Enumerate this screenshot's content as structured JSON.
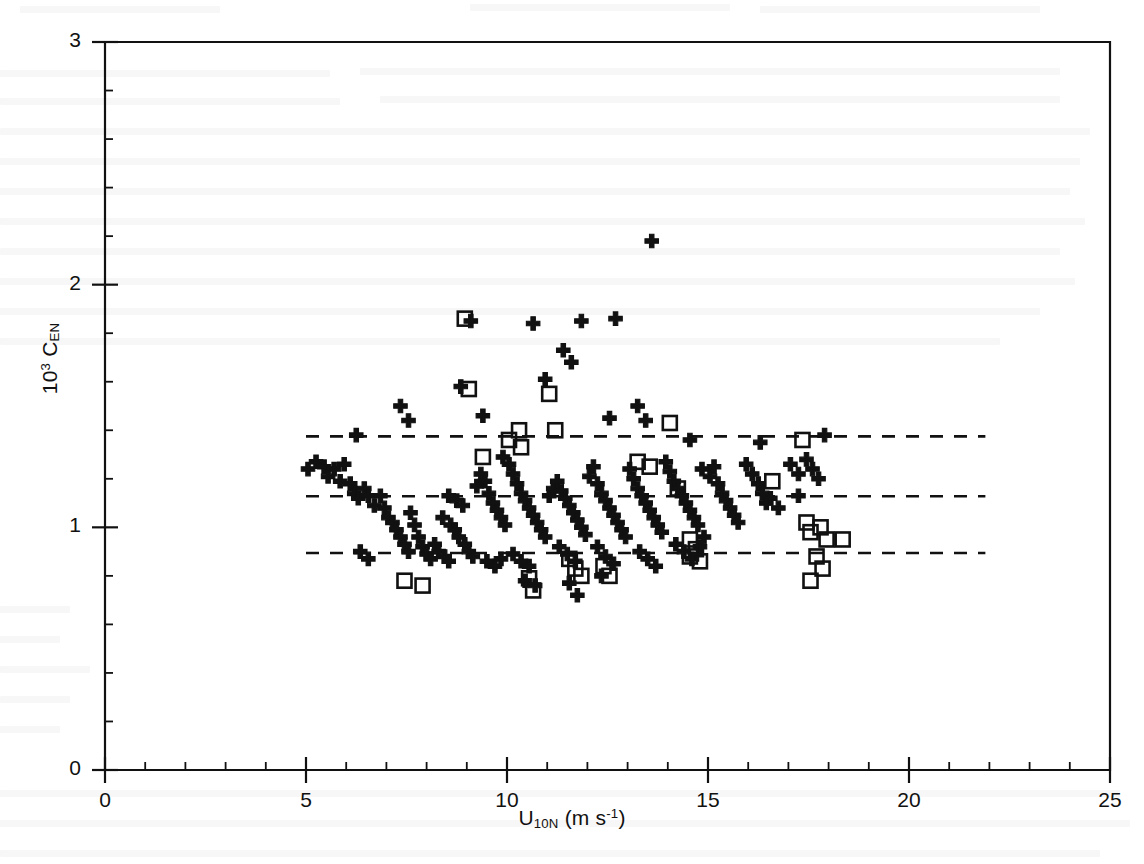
{
  "figure": {
    "background_color": "#ffffff",
    "ink_color": "#111111"
  },
  "axes": {
    "x": {
      "label_html": "U<sub>10N</sub> (m s<sup>-1</sup>)",
      "label_text": "U10N (m s-1)",
      "min": 0,
      "max": 25,
      "major_ticks": [
        0,
        5,
        10,
        15,
        20,
        25
      ],
      "tick_labels": [
        "0",
        "5",
        "10",
        "15",
        "20",
        "25"
      ],
      "minor_tick_step": 1,
      "pixel_min": 105,
      "pixel_max": 1110
    },
    "y": {
      "label_html": "10<sup>3</sup> C<sub>EN</sub>",
      "label_text": "10^3 C_EN",
      "min": 0,
      "max": 3,
      "major_ticks": [
        0,
        1,
        2,
        3
      ],
      "tick_labels": [
        "0",
        "1",
        "2",
        "3"
      ],
      "minor_tick_step": 0.2,
      "pixel_min": 770,
      "pixel_max": 42
    },
    "frame": {
      "left": 105,
      "right": 1110,
      "top": 42,
      "bottom": 770
    }
  },
  "chart_data": {
    "type": "scatter",
    "title": "",
    "xlabel": "U10N (m s-1)",
    "ylabel": "10^3 C_EN",
    "xlim": [
      0,
      25
    ],
    "ylim": [
      0,
      3
    ],
    "grid": false,
    "legend": "none",
    "reference_lines": [
      {
        "name": "upper-bound",
        "y": 1.375,
        "style": "dashed",
        "x_start": 5.0,
        "x_end": 21.9
      },
      {
        "name": "mean",
        "y": 1.128,
        "style": "dashed",
        "x_start": 5.0,
        "x_end": 21.9
      },
      {
        "name": "lower-bound",
        "y": 0.894,
        "style": "dashed",
        "x_start": 5.0,
        "x_end": 21.9
      }
    ],
    "series": [
      {
        "name": "filled-cross",
        "marker": "cross-filled",
        "color": "#111111",
        "points": [
          [
            5.05,
            1.24
          ],
          [
            5.25,
            1.27
          ],
          [
            5.45,
            1.25
          ],
          [
            5.55,
            1.21
          ],
          [
            5.7,
            1.24
          ],
          [
            5.85,
            1.19
          ],
          [
            5.95,
            1.26
          ],
          [
            6.1,
            1.18
          ],
          [
            6.2,
            1.14
          ],
          [
            6.3,
            1.12
          ],
          [
            6.45,
            1.16
          ],
          [
            6.55,
            1.13
          ],
          [
            6.35,
            0.9
          ],
          [
            6.55,
            0.87
          ],
          [
            6.25,
            1.38
          ],
          [
            6.7,
            1.09
          ],
          [
            6.85,
            1.13
          ],
          [
            6.95,
            1.08
          ],
          [
            7.05,
            1.04
          ],
          [
            7.15,
            1.02
          ],
          [
            7.25,
            0.99
          ],
          [
            7.35,
            0.96
          ],
          [
            7.45,
            0.93
          ],
          [
            7.55,
            0.9
          ],
          [
            7.6,
            1.06
          ],
          [
            7.7,
            1.01
          ],
          [
            7.8,
            0.96
          ],
          [
            7.35,
            1.5
          ],
          [
            7.55,
            1.44
          ],
          [
            7.9,
            0.92
          ],
          [
            8.0,
            0.89
          ],
          [
            8.1,
            0.87
          ],
          [
            8.2,
            0.93
          ],
          [
            8.3,
            0.9
          ],
          [
            8.45,
            0.88
          ],
          [
            8.55,
            0.86
          ],
          [
            8.4,
            1.04
          ],
          [
            8.6,
            1.01
          ],
          [
            8.7,
            0.99
          ],
          [
            8.8,
            0.96
          ],
          [
            8.55,
            1.13
          ],
          [
            8.75,
            1.11
          ],
          [
            8.9,
            1.09
          ],
          [
            8.95,
            0.93
          ],
          [
            9.05,
            0.9
          ],
          [
            9.15,
            0.88
          ],
          [
            8.85,
            1.58
          ],
          [
            9.1,
            1.85
          ],
          [
            9.25,
            1.17
          ],
          [
            9.35,
            1.22
          ],
          [
            9.45,
            1.19
          ],
          [
            9.55,
            1.14
          ],
          [
            9.65,
            1.1
          ],
          [
            9.75,
            1.07
          ],
          [
            9.85,
            1.04
          ],
          [
            9.95,
            1.01
          ],
          [
            9.5,
            0.86
          ],
          [
            9.7,
            0.84
          ],
          [
            9.85,
            0.87
          ],
          [
            9.4,
            1.46
          ],
          [
            9.9,
            1.29
          ],
          [
            10.05,
            1.26
          ],
          [
            10.15,
            1.22
          ],
          [
            10.25,
            1.18
          ],
          [
            10.35,
            1.14
          ],
          [
            10.45,
            1.11
          ],
          [
            10.55,
            1.08
          ],
          [
            10.65,
            1.05
          ],
          [
            10.75,
            1.02
          ],
          [
            10.85,
            0.99
          ],
          [
            10.95,
            0.96
          ],
          [
            10.15,
            0.89
          ],
          [
            10.35,
            0.86
          ],
          [
            10.55,
            0.84
          ],
          [
            10.45,
            0.78
          ],
          [
            10.7,
            0.76
          ],
          [
            10.65,
            1.84
          ],
          [
            10.95,
            1.61
          ],
          [
            11.05,
            1.13
          ],
          [
            11.15,
            1.16
          ],
          [
            11.25,
            1.19
          ],
          [
            11.35,
            1.15
          ],
          [
            11.45,
            1.12
          ],
          [
            11.55,
            1.09
          ],
          [
            11.65,
            1.06
          ],
          [
            11.75,
            1.03
          ],
          [
            11.85,
            1.0
          ],
          [
            11.95,
            0.97
          ],
          [
            11.3,
            0.92
          ],
          [
            11.5,
            0.89
          ],
          [
            11.7,
            0.86
          ],
          [
            11.55,
            0.77
          ],
          [
            11.75,
            0.72
          ],
          [
            11.4,
            1.73
          ],
          [
            11.6,
            1.68
          ],
          [
            11.85,
            1.85
          ],
          [
            12.05,
            1.21
          ],
          [
            12.15,
            1.25
          ],
          [
            12.25,
            1.18
          ],
          [
            12.35,
            1.14
          ],
          [
            12.45,
            1.11
          ],
          [
            12.55,
            1.08
          ],
          [
            12.65,
            1.05
          ],
          [
            12.75,
            1.02
          ],
          [
            12.85,
            0.99
          ],
          [
            12.95,
            0.96
          ],
          [
            12.25,
            0.92
          ],
          [
            12.45,
            0.88
          ],
          [
            12.65,
            0.85
          ],
          [
            12.35,
            0.8
          ],
          [
            12.55,
            1.45
          ],
          [
            12.7,
            1.86
          ],
          [
            13.05,
            1.24
          ],
          [
            13.15,
            1.2
          ],
          [
            13.25,
            1.16
          ],
          [
            13.35,
            1.13
          ],
          [
            13.45,
            1.1
          ],
          [
            13.55,
            1.07
          ],
          [
            13.65,
            1.04
          ],
          [
            13.75,
            1.01
          ],
          [
            13.85,
            0.98
          ],
          [
            13.3,
            0.9
          ],
          [
            13.5,
            0.87
          ],
          [
            13.7,
            0.84
          ],
          [
            13.25,
            1.5
          ],
          [
            13.45,
            1.44
          ],
          [
            13.6,
            2.18
          ],
          [
            13.95,
            1.27
          ],
          [
            14.05,
            1.23
          ],
          [
            14.15,
            1.19
          ],
          [
            14.25,
            1.16
          ],
          [
            14.35,
            1.13
          ],
          [
            14.45,
            1.1
          ],
          [
            14.55,
            1.07
          ],
          [
            14.65,
            1.04
          ],
          [
            14.75,
            1.01
          ],
          [
            14.2,
            0.93
          ],
          [
            14.4,
            0.9
          ],
          [
            14.6,
            0.87
          ],
          [
            14.8,
            0.92
          ],
          [
            14.9,
            0.96
          ],
          [
            14.55,
            1.36
          ],
          [
            14.85,
            1.24
          ],
          [
            15.05,
            1.21
          ],
          [
            15.15,
            1.25
          ],
          [
            15.25,
            1.18
          ],
          [
            15.35,
            1.14
          ],
          [
            15.45,
            1.11
          ],
          [
            15.55,
            1.08
          ],
          [
            15.65,
            1.05
          ],
          [
            15.75,
            1.02
          ],
          [
            15.95,
            1.26
          ],
          [
            16.1,
            1.22
          ],
          [
            16.25,
            1.18
          ],
          [
            16.35,
            1.14
          ],
          [
            16.45,
            1.1
          ],
          [
            16.3,
            1.35
          ],
          [
            16.55,
            1.12
          ],
          [
            16.75,
            1.08
          ],
          [
            17.05,
            1.26
          ],
          [
            17.25,
            1.22
          ],
          [
            17.45,
            1.28
          ],
          [
            17.6,
            1.24
          ],
          [
            17.75,
            1.2
          ],
          [
            17.9,
            1.38
          ],
          [
            17.25,
            1.13
          ]
        ]
      },
      {
        "name": "open-square",
        "marker": "square-open",
        "color": "#111111",
        "points": [
          [
            7.45,
            0.78
          ],
          [
            7.9,
            0.76
          ],
          [
            8.95,
            1.86
          ],
          [
            9.05,
            1.57
          ],
          [
            9.4,
            1.29
          ],
          [
            10.05,
            1.36
          ],
          [
            10.3,
            1.4
          ],
          [
            10.35,
            1.33
          ],
          [
            10.55,
            0.79
          ],
          [
            10.65,
            0.74
          ],
          [
            11.05,
            1.55
          ],
          [
            11.2,
            1.4
          ],
          [
            11.55,
            0.87
          ],
          [
            11.7,
            0.83
          ],
          [
            11.85,
            0.8
          ],
          [
            12.4,
            0.84
          ],
          [
            12.55,
            0.8
          ],
          [
            13.25,
            1.27
          ],
          [
            13.55,
            1.25
          ],
          [
            14.05,
            1.43
          ],
          [
            14.25,
            1.16
          ],
          [
            14.55,
            0.95
          ],
          [
            14.7,
            0.91
          ],
          [
            14.55,
            0.88
          ],
          [
            14.8,
            0.86
          ],
          [
            16.6,
            1.19
          ],
          [
            17.35,
            1.36
          ],
          [
            17.45,
            1.02
          ],
          [
            17.55,
            0.98
          ],
          [
            17.8,
            1.0
          ],
          [
            17.95,
            0.95
          ],
          [
            17.7,
            0.88
          ],
          [
            17.85,
            0.83
          ],
          [
            18.35,
            0.95
          ],
          [
            17.55,
            0.78
          ]
        ]
      }
    ]
  }
}
